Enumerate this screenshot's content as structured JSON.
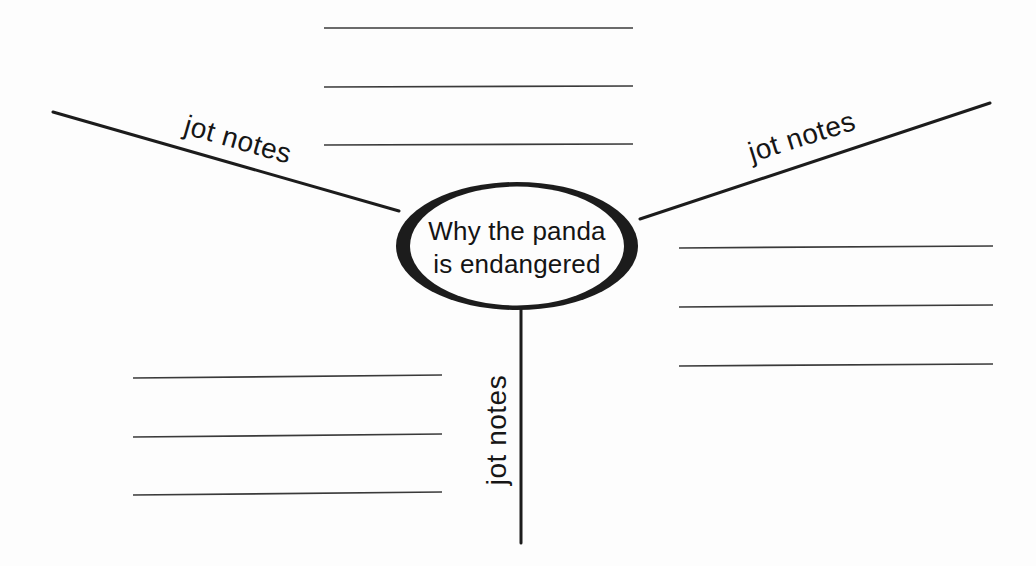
{
  "page": {
    "background_color": "#fdfdfd",
    "ink_color": "#1c1c1c",
    "note_line_color": "#3a3a3a"
  },
  "diagram": {
    "type": "web-organizer",
    "center_topic": {
      "line1": "Why the panda",
      "line2": "is endangered"
    },
    "branches": [
      {
        "id": "top-left",
        "label": "jot notes"
      },
      {
        "id": "top-right",
        "label": "jot notes"
      },
      {
        "id": "bottom",
        "label": "jot notes"
      }
    ],
    "note_line_groups": [
      {
        "id": "top",
        "lines": 3
      },
      {
        "id": "right",
        "lines": 3
      },
      {
        "id": "bottom-left",
        "lines": 3
      }
    ]
  }
}
